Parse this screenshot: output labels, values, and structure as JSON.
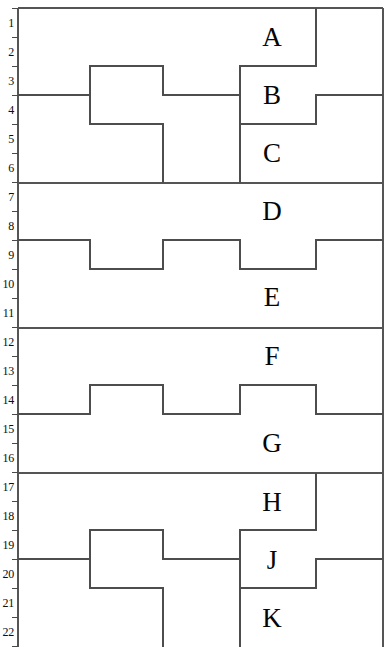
{
  "figure": {
    "kind": "stratigraphic-cross-section",
    "width": 389,
    "height": 647,
    "background": "#ffffff",
    "line_color": "#4d4d4d",
    "frame_color": "#555555",
    "text_color": "#0d0d0d"
  },
  "depth_scale": {
    "axis_label": "",
    "tick_top_y": 8,
    "tick_spacing": 29,
    "axis_x": 18,
    "numbers": [
      "1",
      "2",
      "3",
      "4",
      "5",
      "6",
      "7",
      "8",
      "9",
      "10",
      "11",
      "12",
      "13",
      "14",
      "15",
      "16",
      "17",
      "18",
      "19",
      "20",
      "21",
      "22"
    ]
  },
  "units": [
    {
      "id": "A",
      "label": "A",
      "x": 272,
      "y": 38,
      "panel": 1
    },
    {
      "id": "B",
      "label": "B",
      "x": 272,
      "y": 96,
      "panel": 1
    },
    {
      "id": "C",
      "label": "C",
      "x": 272,
      "y": 154,
      "panel": 1
    },
    {
      "id": "D",
      "label": "D",
      "x": 272,
      "y": 212,
      "panel": 2
    },
    {
      "id": "E",
      "label": "E",
      "x": 272,
      "y": 298,
      "panel": 2
    },
    {
      "id": "F",
      "label": "F",
      "x": 272,
      "y": 357,
      "panel": 3
    },
    {
      "id": "G",
      "label": "G",
      "x": 272,
      "y": 444,
      "panel": 3
    },
    {
      "id": "H",
      "label": "H",
      "x": 272,
      "y": 503,
      "panel": 4
    },
    {
      "id": "J",
      "label": "J",
      "x": 272,
      "y": 561,
      "panel": 4
    },
    {
      "id": "K",
      "label": "K",
      "x": 272,
      "y": 619,
      "panel": 4
    }
  ],
  "panels": [
    {
      "index": 1,
      "top": 8,
      "bottom": 183,
      "units": [
        "A",
        "B",
        "C"
      ],
      "boundary_style": "stepped"
    },
    {
      "index": 2,
      "top": 183,
      "bottom": 328,
      "units": [
        "D",
        "E"
      ],
      "boundary_style": "square-wave"
    },
    {
      "index": 3,
      "top": 328,
      "bottom": 473,
      "units": [
        "F",
        "G"
      ],
      "boundary_style": "square-wave-inverted"
    },
    {
      "index": 4,
      "top": 473,
      "bottom": 647,
      "units": [
        "H",
        "J",
        "K"
      ],
      "boundary_style": "stepped"
    }
  ],
  "geometry": {
    "frame_left": 18,
    "frame_right": 383,
    "frame_top": 8,
    "frame_bottom": 647,
    "step_x": [
      90,
      163,
      240,
      316
    ],
    "divider_y": [
      183,
      328,
      473
    ]
  }
}
